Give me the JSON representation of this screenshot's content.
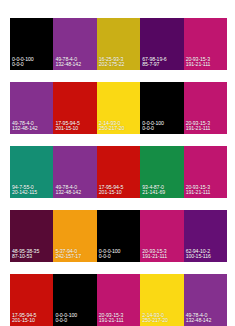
{
  "sheet": {
    "title": "Color palette swatch sheet",
    "background": "#ffffff",
    "label_color": "#ffffff",
    "rows": 5,
    "columns": 5
  },
  "rows": [
    {
      "name": "palette-row-1",
      "swatches": [
        {
          "cmyk": "0-0-0-100",
          "rgb": "0-0-0",
          "hex": "#000000"
        },
        {
          "cmyk": "49-78-4-0",
          "rgb": "132-48-142",
          "hex": "#84308e"
        },
        {
          "cmyk": "16-25-93-3",
          "rgb": "202-175-22",
          "hex": "#caaf16"
        },
        {
          "cmyk": "67-98-19-6",
          "rgb": "85-7-97",
          "hex": "#550761"
        },
        {
          "cmyk": "20-93-15-3",
          "rgb": "191-21-111",
          "hex": "#bf156f"
        }
      ]
    },
    {
      "name": "palette-row-2",
      "swatches": [
        {
          "cmyk": "49-78-4-0",
          "rgb": "132-48-142",
          "hex": "#84308e"
        },
        {
          "cmyk": "17-95-94-5",
          "rgb": "201-15-10",
          "hex": "#c90f0a"
        },
        {
          "cmyk": "2-14-93-0",
          "rgb": "250-217-20",
          "hex": "#fad914"
        },
        {
          "cmyk": "0-0-0-100",
          "rgb": "0-0-0",
          "hex": "#000000"
        },
        {
          "cmyk": "20-93-15-3",
          "rgb": "191-21-111",
          "hex": "#bf156f"
        }
      ]
    },
    {
      "name": "palette-row-3",
      "swatches": [
        {
          "cmyk": "94-7-55-0",
          "rgb": "20-142-115",
          "hex": "#148e73"
        },
        {
          "cmyk": "49-78-4-0",
          "rgb": "132-48-142",
          "hex": "#84308e"
        },
        {
          "cmyk": "17-95-94-5",
          "rgb": "201-15-10",
          "hex": "#c90f0a"
        },
        {
          "cmyk": "93-4-87-0",
          "rgb": "21-141-69",
          "hex": "#158d45"
        },
        {
          "cmyk": "20-93-15-3",
          "rgb": "191-21-111",
          "hex": "#bf156f"
        }
      ]
    },
    {
      "name": "palette-row-4",
      "swatches": [
        {
          "cmyk": "48-95-38-35",
          "rgb": "87-10-53",
          "hex": "#570a35"
        },
        {
          "cmyk": "5-37-94-0",
          "rgb": "242-157-17",
          "hex": "#f29d11"
        },
        {
          "cmyk": "0-0-0-100",
          "rgb": "0-0-0",
          "hex": "#000000"
        },
        {
          "cmyk": "20-93-15-3",
          "rgb": "191-21-111",
          "hex": "#bf156f"
        },
        {
          "cmyk": "62-94-10-2",
          "rgb": "100-15-116",
          "hex": "#640f74"
        }
      ]
    },
    {
      "name": "palette-row-5",
      "swatches": [
        {
          "cmyk": "17-95-94-5",
          "rgb": "201-15-10",
          "hex": "#c90f0a"
        },
        {
          "cmyk": "0-0-0-100",
          "rgb": "0-0-0",
          "hex": "#000000"
        },
        {
          "cmyk": "20-93-15-3",
          "rgb": "191-21-111",
          "hex": "#bf156f"
        },
        {
          "cmyk": "2-14-93-0",
          "rgb": "250-217-20",
          "hex": "#fad914"
        },
        {
          "cmyk": "49-78-4-0",
          "rgb": "132-48-142",
          "hex": "#84308e"
        }
      ]
    }
  ]
}
